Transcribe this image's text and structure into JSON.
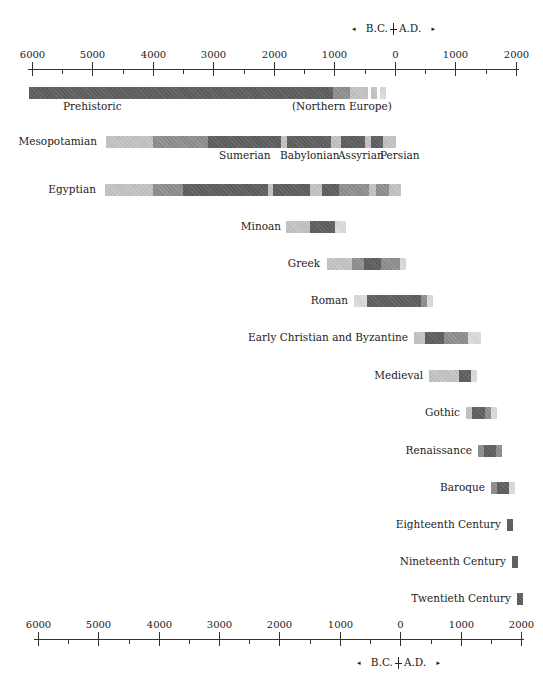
{
  "chart_data": {
    "type": "timeline",
    "title": "",
    "xlabel": "B.C. | A.D.",
    "x_range": [
      -6000,
      2000
    ],
    "ticks_major": [
      -6000,
      -5000,
      -4000,
      -3000,
      -2000,
      -1000,
      0,
      1000,
      2000
    ],
    "ticks_minor": [
      -5500,
      -4500,
      -3500,
      -2500,
      -1500,
      -500,
      500,
      1500
    ],
    "tick_labels": [
      "6000",
      "5000",
      "4000",
      "3000",
      "2000",
      "1000",
      "0",
      "1000",
      "2000"
    ],
    "era_label": {
      "left": "B.C.",
      "right": "A.D."
    },
    "periods": [
      {
        "name": "Prehistoric",
        "start": -6000,
        "end": -200,
        "note": "(Northern Europe)"
      },
      {
        "name": "Mesopotamian",
        "start": -4800,
        "end": -15,
        "sub_periods": [
          "Sumerian",
          "Babylonian",
          "Assyrian",
          "Persian"
        ]
      },
      {
        "name": "Egyptian",
        "start": -4850,
        "end": 100
      },
      {
        "name": "Minoan",
        "start": -1800,
        "end": -800
      },
      {
        "name": "Greek",
        "start": -1100,
        "end": 180
      },
      {
        "name": "Roman",
        "start": -700,
        "end": 630
      },
      {
        "name": "Early Christian and Byzantine",
        "start": 320,
        "end": 1430
      },
      {
        "name": "Medieval",
        "start": 560,
        "end": 1360
      },
      {
        "name": "Gothic",
        "start": 1180,
        "end": 1690
      },
      {
        "name": "Renaissance",
        "start": 1380,
        "end": 1780
      },
      {
        "name": "Baroque",
        "start": 1590,
        "end": 1990
      },
      {
        "name": "Eighteenth Century",
        "start": 1850,
        "end": 1950
      },
      {
        "name": "Nineteenth Century",
        "start": 1930,
        "end": 2030
      },
      {
        "name": "Twentieth Century",
        "start": 2010,
        "end": 2110
      }
    ]
  },
  "axis_top": {
    "y": 69,
    "x0": 28,
    "x1": 519,
    "labels_y": 49,
    "ticks": [
      {
        "x": 32,
        "major": true,
        "label": "6000"
      },
      {
        "x": 62,
        "major": false
      },
      {
        "x": 92,
        "major": true,
        "label": "5000"
      },
      {
        "x": 123,
        "major": false
      },
      {
        "x": 153,
        "major": true,
        "label": "4000"
      },
      {
        "x": 183,
        "major": false
      },
      {
        "x": 213,
        "major": true,
        "label": "3000"
      },
      {
        "x": 244,
        "major": false
      },
      {
        "x": 274,
        "major": true,
        "label": "2000"
      },
      {
        "x": 304,
        "major": false
      },
      {
        "x": 334,
        "major": true,
        "label": "1000"
      },
      {
        "x": 365,
        "major": false
      },
      {
        "x": 395,
        "major": true,
        "label": "0"
      },
      {
        "x": 425,
        "major": false
      },
      {
        "x": 455,
        "major": true,
        "label": "1000"
      },
      {
        "x": 486,
        "major": false
      },
      {
        "x": 516,
        "major": true,
        "label": "2000"
      }
    ],
    "bcad": {
      "x": 352,
      "y": 22,
      "left_arrow": "◂",
      "bc": "B.C.",
      "ad": "A.D.",
      "right_arrow": "▸"
    }
  },
  "axis_bottom": {
    "y": 639,
    "x0": 34,
    "x1": 524,
    "labels_y": 619,
    "ticks": [
      {
        "x": 38,
        "major": true,
        "label": "6000"
      },
      {
        "x": 68,
        "major": false
      },
      {
        "x": 98,
        "major": true,
        "label": "5000"
      },
      {
        "x": 129,
        "major": false
      },
      {
        "x": 159,
        "major": true,
        "label": "4000"
      },
      {
        "x": 189,
        "major": false
      },
      {
        "x": 219,
        "major": true,
        "label": "3000"
      },
      {
        "x": 249,
        "major": false
      },
      {
        "x": 279,
        "major": true,
        "label": "2000"
      },
      {
        "x": 310,
        "major": false
      },
      {
        "x": 340,
        "major": true,
        "label": "1000"
      },
      {
        "x": 370,
        "major": false
      },
      {
        "x": 400,
        "major": true,
        "label": "0"
      },
      {
        "x": 431,
        "major": false
      },
      {
        "x": 461,
        "major": true,
        "label": "1000"
      },
      {
        "x": 491,
        "major": false
      },
      {
        "x": 521,
        "major": true,
        "label": "2000"
      }
    ],
    "bcad": {
      "x": 357,
      "y": 656,
      "left_arrow": "◂",
      "bc": "B.C.",
      "ad": "A.D.",
      "right_arrow": "▸"
    }
  },
  "rows": [
    {
      "id": "prehistoric",
      "label": "Prehistoric",
      "label_pos": "below",
      "label_x": 63,
      "label_y": 100,
      "extra_label": "(Northern Europe)",
      "extra_x": 292,
      "extra_y": 100,
      "y": 87,
      "h": 12,
      "segments": [
        {
          "x0": 29,
          "x1": 333,
          "shade": "dark"
        },
        {
          "x0": 333,
          "x1": 350,
          "shade": "mid"
        },
        {
          "x0": 350,
          "x1": 368,
          "shade": "light"
        },
        {
          "x0": 371,
          "x1": 377,
          "shade": "light"
        },
        {
          "x0": 380,
          "x1": 386,
          "shade": "pale"
        }
      ]
    },
    {
      "id": "mesopotamian",
      "label": "Mesopotamian",
      "label_pos": "left",
      "label_x": 97,
      "label_y": 136,
      "y": 136,
      "h": 12,
      "sub_labels": [
        {
          "text": "Sumerian",
          "x": 219,
          "y": 149
        },
        {
          "text": "Babylonian",
          "x": 280,
          "y": 149
        },
        {
          "text": "Assyrian",
          "x": 338,
          "y": 149
        },
        {
          "text": "Persian",
          "x": 380,
          "y": 149
        }
      ],
      "segments": [
        {
          "x0": 106,
          "x1": 153,
          "shade": "light"
        },
        {
          "x0": 153,
          "x1": 208,
          "shade": "mid"
        },
        {
          "x0": 208,
          "x1": 281,
          "shade": "dark"
        },
        {
          "x0": 281,
          "x1": 287,
          "shade": "light"
        },
        {
          "x0": 287,
          "x1": 331,
          "shade": "dark"
        },
        {
          "x0": 331,
          "x1": 341,
          "shade": "light"
        },
        {
          "x0": 341,
          "x1": 365,
          "shade": "dark"
        },
        {
          "x0": 365,
          "x1": 371,
          "shade": "light"
        },
        {
          "x0": 371,
          "x1": 383,
          "shade": "dark"
        },
        {
          "x0": 383,
          "x1": 396,
          "shade": "light"
        }
      ]
    },
    {
      "id": "egyptian",
      "label": "Egyptian",
      "label_pos": "left",
      "label_x": 96,
      "label_y": 184,
      "y": 184,
      "h": 12,
      "segments": [
        {
          "x0": 105,
          "x1": 153,
          "shade": "light"
        },
        {
          "x0": 153,
          "x1": 183,
          "shade": "mid"
        },
        {
          "x0": 183,
          "x1": 268,
          "shade": "dark"
        },
        {
          "x0": 268,
          "x1": 273,
          "shade": "light"
        },
        {
          "x0": 273,
          "x1": 310,
          "shade": "dark"
        },
        {
          "x0": 310,
          "x1": 322,
          "shade": "light"
        },
        {
          "x0": 322,
          "x1": 339,
          "shade": "dark"
        },
        {
          "x0": 339,
          "x1": 369,
          "shade": "mid"
        },
        {
          "x0": 369,
          "x1": 376,
          "shade": "light"
        },
        {
          "x0": 376,
          "x1": 389,
          "shade": "mid"
        },
        {
          "x0": 389,
          "x1": 401,
          "shade": "light"
        }
      ]
    },
    {
      "id": "minoan",
      "label": "Minoan",
      "label_pos": "left",
      "label_x": 281,
      "label_y": 221,
      "y": 221,
      "h": 12,
      "segments": [
        {
          "x0": 286,
          "x1": 310,
          "shade": "light"
        },
        {
          "x0": 310,
          "x1": 335,
          "shade": "dark"
        },
        {
          "x0": 335,
          "x1": 346,
          "shade": "pale"
        }
      ]
    },
    {
      "id": "greek",
      "label": "Greek",
      "label_pos": "left",
      "label_x": 320,
      "label_y": 258,
      "y": 258,
      "h": 12,
      "segments": [
        {
          "x0": 327,
          "x1": 352,
          "shade": "light"
        },
        {
          "x0": 352,
          "x1": 364,
          "shade": "mid"
        },
        {
          "x0": 364,
          "x1": 381,
          "shade": "dark"
        },
        {
          "x0": 381,
          "x1": 400,
          "shade": "mid"
        },
        {
          "x0": 400,
          "x1": 406,
          "shade": "pale"
        }
      ]
    },
    {
      "id": "roman",
      "label": "Roman",
      "label_pos": "left",
      "label_x": 348,
      "label_y": 295,
      "y": 295,
      "h": 12,
      "segments": [
        {
          "x0": 354,
          "x1": 367,
          "shade": "pale"
        },
        {
          "x0": 367,
          "x1": 421,
          "shade": "dark"
        },
        {
          "x0": 421,
          "x1": 427,
          "shade": "mid"
        },
        {
          "x0": 427,
          "x1": 433,
          "shade": "pale"
        }
      ]
    },
    {
      "id": "early-christian-byzantine",
      "label": "Early Christian and Byzantine",
      "label_pos": "left",
      "label_x": 408,
      "label_y": 332,
      "y": 332,
      "h": 12,
      "segments": [
        {
          "x0": 414,
          "x1": 425,
          "shade": "light"
        },
        {
          "x0": 425,
          "x1": 444,
          "shade": "dark"
        },
        {
          "x0": 444,
          "x1": 468,
          "shade": "mid"
        },
        {
          "x0": 468,
          "x1": 481,
          "shade": "pale"
        }
      ]
    },
    {
      "id": "medieval",
      "label": "Medieval",
      "label_pos": "left",
      "label_x": 423,
      "label_y": 370,
      "y": 370,
      "h": 12,
      "segments": [
        {
          "x0": 429,
          "x1": 459,
          "shade": "light"
        },
        {
          "x0": 459,
          "x1": 471,
          "shade": "dark"
        },
        {
          "x0": 471,
          "x1": 477,
          "shade": "pale"
        }
      ]
    },
    {
      "id": "gothic",
      "label": "Gothic",
      "label_pos": "left",
      "label_x": 460,
      "label_y": 407,
      "y": 407,
      "h": 12,
      "segments": [
        {
          "x0": 466,
          "x1": 472,
          "shade": "light"
        },
        {
          "x0": 472,
          "x1": 485,
          "shade": "dark"
        },
        {
          "x0": 485,
          "x1": 491,
          "shade": "mid"
        },
        {
          "x0": 491,
          "x1": 497,
          "shade": "pale"
        }
      ]
    },
    {
      "id": "renaissance",
      "label": "Renaissance",
      "label_pos": "left",
      "label_x": 472,
      "label_y": 445,
      "y": 445,
      "h": 12,
      "segments": [
        {
          "x0": 478,
          "x1": 484,
          "shade": "mid"
        },
        {
          "x0": 484,
          "x1": 496,
          "shade": "dark"
        },
        {
          "x0": 496,
          "x1": 502,
          "shade": "mid"
        }
      ]
    },
    {
      "id": "baroque",
      "label": "Baroque",
      "label_pos": "left",
      "label_x": 485,
      "label_y": 482,
      "y": 482,
      "h": 12,
      "segments": [
        {
          "x0": 491,
          "x1": 497,
          "shade": "mid"
        },
        {
          "x0": 497,
          "x1": 509,
          "shade": "dark"
        },
        {
          "x0": 509,
          "x1": 515,
          "shade": "pale"
        }
      ]
    },
    {
      "id": "eighteenth-century",
      "label": "Eighteenth Century",
      "label_pos": "left",
      "label_x": 501,
      "label_y": 519,
      "y": 519,
      "h": 12,
      "segments": [
        {
          "x0": 507,
          "x1": 513,
          "shade": "dark"
        }
      ]
    },
    {
      "id": "nineteenth-century",
      "label": "Nineteenth Century",
      "label_pos": "left",
      "label_x": 506,
      "label_y": 556,
      "y": 556,
      "h": 12,
      "segments": [
        {
          "x0": 512,
          "x1": 518,
          "shade": "dark"
        }
      ]
    },
    {
      "id": "twentieth-century",
      "label": "Twentieth Century",
      "label_pos": "left",
      "label_x": 511,
      "label_y": 593,
      "y": 593,
      "h": 12,
      "segments": [
        {
          "x0": 517,
          "x1": 523,
          "shade": "dark"
        }
      ]
    }
  ]
}
